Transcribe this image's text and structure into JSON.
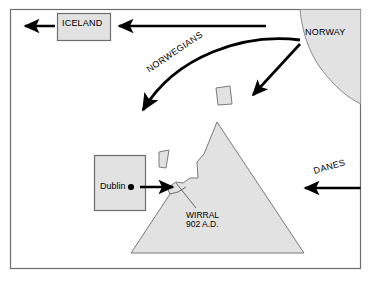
{
  "figure": {
    "frame_color": "#6e6e6e",
    "background_color": "#ffffff",
    "land_fill_color": "#e2e2e2",
    "land_stroke_color": "#7a7a7a",
    "arrow_color": "#000000",
    "box_fill_color": "#e2e2e2",
    "box_stroke_color": "#6e6e6e"
  },
  "labels": {
    "iceland": "ICELAND",
    "norway": "NORWAY",
    "norwegians": "NORWEGIANS",
    "danes": "DANES",
    "dublin": "Dublin",
    "wirral_name": "WIRRAL",
    "wirral_date": "902 A.D."
  },
  "shapes": {
    "iceland_box": "iceland-box",
    "dublin_box": "dublin-box",
    "norway_landmass": "norway-landmass",
    "britain_triangle": "britain-triangle",
    "isle-of-man": "island-shape-large",
    "small-island": "island-shape-small",
    "dublin_dot": "dublin-city-dot",
    "wirral_leader": "wirral-leader-line"
  },
  "arrows": {
    "iceland_outbound": "arrow-iceland-west",
    "norway_to_iceland": "arrow-norway-to-iceland",
    "norwegians_curve": "arrow-norwegians-curved",
    "norway_diagonal": "arrow-norway-diagonal",
    "dublin_to_wirral": "arrow-dublin-to-wirral",
    "danes_inbound": "arrow-danes-west"
  }
}
